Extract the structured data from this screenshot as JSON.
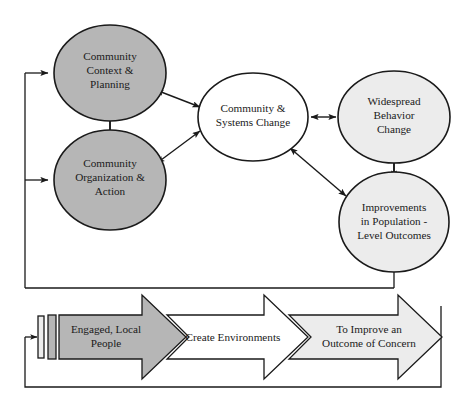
{
  "diagram": {
    "colors": {
      "stroke": "#1a1a1a",
      "fill_dark_gray": "#b6b6b6",
      "fill_light_gray": "#ececec",
      "fill_white": "#ffffff",
      "text": "#1a1a1a",
      "background": "#ffffff"
    },
    "nodes": [
      {
        "id": "community-context-planning",
        "lines": [
          "Community",
          "Context &",
          "Planning"
        ],
        "shape": "ellipse",
        "fill": "dark-gray",
        "cx": 110,
        "cy": 73,
        "rx": 56,
        "ry": 48
      },
      {
        "id": "community-organization-action",
        "lines": [
          "Community",
          "Organization &",
          "Action"
        ],
        "shape": "ellipse",
        "fill": "dark-gray",
        "cx": 110,
        "cy": 180,
        "rx": 56,
        "ry": 50
      },
      {
        "id": "community-systems-change",
        "lines": [
          "Community &",
          "Systems Change"
        ],
        "shape": "ellipse",
        "fill": "white",
        "cx": 253,
        "cy": 117,
        "rx": 55,
        "ry": 44
      },
      {
        "id": "widespread-behavior-change",
        "lines": [
          "Widespread",
          "Behavior",
          "Change"
        ],
        "shape": "ellipse",
        "fill": "light-gray",
        "cx": 394,
        "cy": 117,
        "rx": 56,
        "ry": 46
      },
      {
        "id": "improvements-population-level-outcomes",
        "lines": [
          "Improvements",
          "in Population -",
          "Level Outcomes"
        ],
        "shape": "ellipse",
        "fill": "light-gray",
        "cx": 394,
        "cy": 222,
        "rx": 55,
        "ry": 50
      }
    ],
    "connections": [
      {
        "id": "context-to-systems",
        "from": "community-context-planning",
        "to": "community-systems-change",
        "style": "double-headed"
      },
      {
        "id": "organization-to-systems",
        "from": "community-organization-action",
        "to": "community-systems-change",
        "style": "double-headed"
      },
      {
        "id": "context-to-organization",
        "from": "community-context-planning",
        "to": "community-organization-action",
        "style": "double-headed"
      },
      {
        "id": "systems-to-behavior",
        "from": "community-systems-change",
        "to": "widespread-behavior-change",
        "style": "double-headed"
      },
      {
        "id": "systems-to-improvements",
        "from": "community-systems-change",
        "to": "improvements-population-level-outcomes",
        "style": "double-headed"
      },
      {
        "id": "improvements-to-behavior",
        "from": "improvements-population-level-outcomes",
        "to": "widespread-behavior-change",
        "style": "double-headed"
      },
      {
        "id": "feedback-outcomes-to-context",
        "from": "improvements-population-level-outcomes",
        "to": "community-context-planning",
        "style": "single-headed-feedback"
      },
      {
        "id": "feedback-outcomes-to-organization",
        "from": "improvements-population-level-outcomes",
        "to": "community-organization-action",
        "style": "single-headed-feedback"
      }
    ],
    "process_arrows": [
      {
        "id": "engaged-local-people",
        "lines": [
          "Engaged, Local",
          "People"
        ],
        "fill": "dark-gray",
        "order": 1
      },
      {
        "id": "create-environments",
        "lines": [
          "Create Environments"
        ],
        "fill": "white",
        "order": 2
      },
      {
        "id": "to-improve-an-outcome-of-concern",
        "lines": [
          "To Improve an",
          "Outcome of Concern"
        ],
        "fill": "light-gray",
        "order": 3
      }
    ],
    "process_feedback": {
      "id": "process-return-loop",
      "description": "return loop into left edge of first process arrow"
    }
  }
}
